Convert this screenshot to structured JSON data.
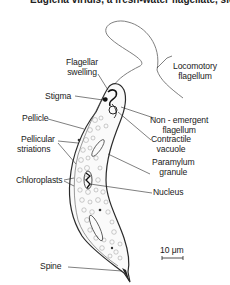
{
  "header": {
    "cut_text": "Euglena viridis, a fresh-water flagellate, side view in outline"
  },
  "labels": {
    "flagellar_swelling": "Flagellar\nswelling",
    "flagellar_swelling_1": "Flagellar",
    "flagellar_swelling_2": "swelling",
    "stigma": "Stigma",
    "locomotory_flagellum_1": "Locomotory",
    "locomotory_flagellum_2": "flagellum",
    "non_emergent_flagellum_1": "Non - emergent",
    "non_emergent_flagellum_2": "flagellum",
    "pellicle": "Pellicle",
    "contractile_vacuole_1": "Contractile",
    "contractile_vacuole_2": "vacuole",
    "pellicular_striations_1": "Pellicular",
    "pellicular_striations_2": "striations",
    "paramylum_granule_1": "Paramylum",
    "paramylum_granule_2": "granule",
    "chloroplasts": "Chloroplasts",
    "nucleus": "Nucleus",
    "spine": "Spine"
  },
  "scale_bar": {
    "label": "10 μm"
  },
  "colors": {
    "line": "#2a2a2a",
    "flagellum": "#6a6a6a",
    "background": "#ffffff"
  }
}
